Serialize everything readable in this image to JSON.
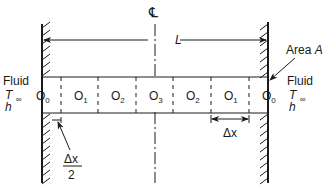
{
  "diagram": {
    "centerline_symbol": "℄",
    "length_label": "L",
    "area_label": "Area",
    "area_symbol": "A",
    "left_fluid": {
      "label": "Fluid",
      "temp_symbol": "T",
      "temp_subscript": "∞",
      "coeff_symbol": "h"
    },
    "right_fluid": {
      "label": "Fluid",
      "temp_symbol": "T",
      "temp_subscript": "∞",
      "coeff_symbol": "h"
    },
    "nodes": [
      {
        "base": "O",
        "sub": "0"
      },
      {
        "base": "O",
        "sub": "1"
      },
      {
        "base": "O",
        "sub": "2"
      },
      {
        "base": "O",
        "sub": "3"
      },
      {
        "base": "O",
        "sub": "2"
      },
      {
        "base": "O",
        "sub": "1"
      },
      {
        "base": "O",
        "sub": "0"
      }
    ],
    "dx_label": "Δx",
    "half_dx_numerator": "Δx",
    "half_dx_denominator": "2",
    "colors": {
      "line": "#1a1a1a",
      "background": "#ffffff"
    }
  }
}
